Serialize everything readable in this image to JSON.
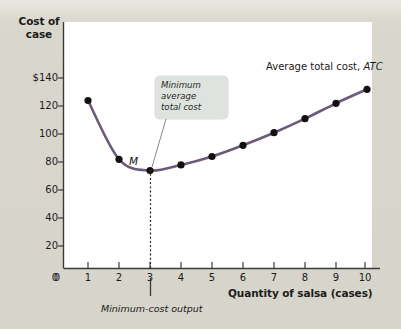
{
  "chart_data": {
    "type": "line",
    "title": "",
    "xlabel": "Quantity of salsa (cases)",
    "ylabel": "Cost of case",
    "ylabel_line1": "Cost of",
    "ylabel_line2": "case",
    "x": [
      1,
      2,
      3,
      4,
      5,
      6,
      7,
      8,
      9,
      10
    ],
    "series": [
      {
        "name": "Average total cost, ATC",
        "values": [
          120,
          78,
          70,
          74,
          80,
          88,
          97,
          107,
          118,
          128
        ],
        "color": "#6c5b78",
        "marker_color": "#111111"
      }
    ],
    "xlim": [
      0,
      10.6
    ],
    "ylim": [
      0,
      150
    ],
    "xticks": [
      "0",
      "1",
      "2",
      "3",
      "4",
      "5",
      "6",
      "7",
      "8",
      "9",
      "10"
    ],
    "yticks": [
      "0",
      "20",
      "40",
      "60",
      "80",
      "100",
      "120",
      "$140"
    ],
    "ytick_values": [
      0,
      20,
      40,
      60,
      80,
      100,
      120,
      140
    ],
    "grid": false,
    "legend_position": "inline-annotation",
    "annotations": [
      {
        "name": "series-label",
        "text": "Average total cost, ",
        "italic_text": "ATC",
        "x": 9,
        "y": 140
      },
      {
        "name": "minimum-point-label",
        "text": "M",
        "x": 3,
        "y": 70
      },
      {
        "name": "callout",
        "text": "Minimum average total cost",
        "line1": "Minimum",
        "line2": "average",
        "line3": "total cost",
        "points_to_x": 3,
        "points_to_y": 70
      },
      {
        "name": "min-cost-output-label",
        "text": "Minimum-cost output",
        "x": 3
      }
    ],
    "dotted_guide": {
      "at_x": 3,
      "from_y": 70,
      "to_y": 0
    }
  },
  "colors": {
    "figure_background": "#d9d6ce",
    "plot_background": "#ffffff",
    "curve": "#6c5b78",
    "marker": "#111111",
    "axis": "#3a3a3a",
    "callout_background": "#dfe3df",
    "text": "#1b1b1b"
  }
}
